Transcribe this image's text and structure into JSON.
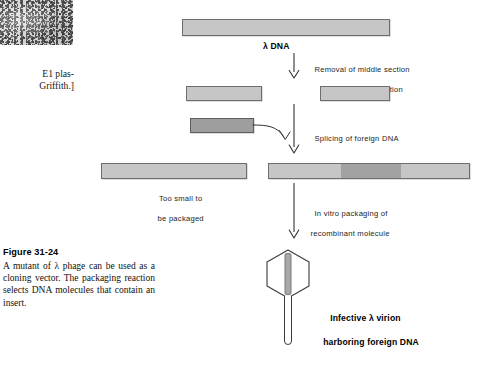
{
  "figure": {
    "caption_title": "Figure 31-24",
    "caption_body": "A mutant of λ phage can be used as a cloning vector. The packaging reaction selects DNA molecules that contain an insert.",
    "credit_text": "E1 plas-\nGriffith.]"
  },
  "diagram": {
    "title": "λ DNA",
    "steps": [
      {
        "id": "restriction",
        "line1": "Removal of middle section",
        "line2": "by restriction digestion"
      },
      {
        "id": "splicing",
        "line1": "Splicing of foreign DNA",
        "line2": ""
      },
      {
        "id": "packaging",
        "line1": "In vitro packaging of",
        "line2": "recombinant molecule"
      }
    ],
    "labels": {
      "too_small_line1": "Too small to",
      "too_small_line2": "be packaged",
      "virion_line1": "Infective λ virion",
      "virion_line2": "harboring foreign DNA"
    },
    "bars": [
      {
        "id": "lambda-dna",
        "x": 182,
        "y": 19,
        "w": 208,
        "h": 17,
        "shade": "light"
      },
      {
        "id": "left-arm",
        "x": 186,
        "y": 86,
        "w": 76,
        "h": 15,
        "shade": "light"
      },
      {
        "id": "right-arm",
        "x": 320,
        "y": 86,
        "w": 70,
        "h": 15,
        "shade": "light"
      },
      {
        "id": "foreign-dna",
        "x": 190,
        "y": 118,
        "w": 64,
        "h": 15,
        "shade": "dark"
      },
      {
        "id": "too-small-product",
        "x": 101,
        "y": 163,
        "w": 146,
        "h": 16,
        "shade": "light"
      },
      {
        "id": "recombinant",
        "x": 268,
        "y": 163,
        "w": 202,
        "h": 16,
        "shade": "light",
        "insert_x": 72,
        "insert_w": 60
      }
    ],
    "colors": {
      "bar_fill": "#c6c6c6",
      "bar_fill_dark": "#9e9e9e",
      "bar_stroke": "#6d6d6d",
      "arrow_stroke": "#333333",
      "phage_stroke": "#3a3a3a",
      "text": "#101010"
    }
  }
}
